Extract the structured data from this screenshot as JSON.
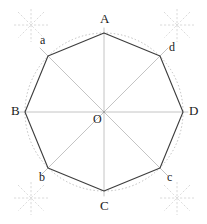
{
  "figure": {
    "type": "geometry-construction",
    "width": 207,
    "height": 224,
    "center": {
      "x": 104,
      "y": 112,
      "label": "O"
    },
    "circle": {
      "radius": 79,
      "style": "dotted",
      "color": "#b9b9b9"
    },
    "polygon": {
      "sides": 8,
      "stroke": "#3a3a3a",
      "stroke_width": 1.1,
      "fill": "none"
    },
    "diagonals": {
      "color": "#c2c2c2",
      "stroke_width": 1,
      "count": 4
    },
    "construction_marks": {
      "color": "#d2d2d2",
      "style": "dashed-arc-crossings",
      "count": 4
    },
    "vertices": [
      {
        "id": "A",
        "label": "A",
        "angle_deg": 90,
        "x": 104,
        "y": 33,
        "label_x": 100,
        "label_y": 12,
        "class": "lbl-maj"
      },
      {
        "id": "d",
        "label": "d",
        "angle_deg": 45,
        "x": 160,
        "y": 56,
        "label_x": 169,
        "label_y": 41,
        "class": "lbl-min"
      },
      {
        "id": "D",
        "label": "D",
        "angle_deg": 0,
        "x": 183,
        "y": 112,
        "label_x": 189,
        "label_y": 104,
        "class": "lbl-maj"
      },
      {
        "id": "c",
        "label": "c",
        "angle_deg": 315,
        "x": 160,
        "y": 168,
        "label_x": 167,
        "label_y": 171,
        "class": "lbl-min"
      },
      {
        "id": "C",
        "label": "C",
        "angle_deg": 270,
        "x": 104,
        "y": 191,
        "label_x": 100,
        "label_y": 199,
        "class": "lbl-maj"
      },
      {
        "id": "b",
        "label": "b",
        "angle_deg": 225,
        "x": 48,
        "y": 168,
        "label_x": 39,
        "label_y": 171,
        "class": "lbl-min"
      },
      {
        "id": "B",
        "label": "B",
        "angle_deg": 180,
        "x": 25,
        "y": 112,
        "label_x": 11,
        "label_y": 104,
        "class": "lbl-maj"
      },
      {
        "id": "a",
        "label": "a",
        "angle_deg": 135,
        "x": 48,
        "y": 56,
        "label_x": 40,
        "label_y": 34,
        "class": "lbl-min"
      }
    ],
    "center_label": {
      "text": "O",
      "x": 93,
      "y": 113
    }
  }
}
